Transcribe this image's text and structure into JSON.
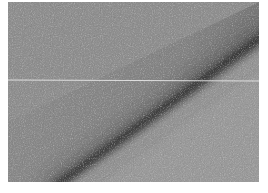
{
  "image": {
    "kind": "grayscale-photograph",
    "subject": "textured surface with diagonal dark crease",
    "colors": {
      "upper_left_tone": "#8e8e8e",
      "lower_right_tone": "#9a9a9a",
      "crease_tone": "#2a2a2a",
      "scan_line_tone": "#e6e6e6",
      "margin": "#ffffff"
    },
    "features": {
      "crease": {
        "from": [
          52,
          180
        ],
        "to": [
          251,
          38
        ]
      },
      "horizontal_line_y": 78
    }
  }
}
